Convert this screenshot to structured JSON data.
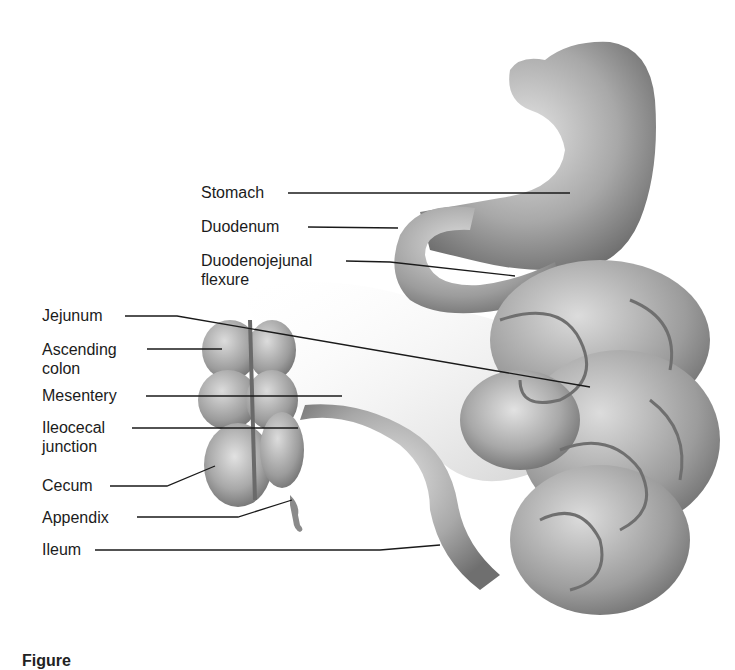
{
  "figure": {
    "caption_partial": "Figure",
    "labels": [
      {
        "id": "stomach",
        "text": "Stomach"
      },
      {
        "id": "duodenum",
        "text": "Duodenum"
      },
      {
        "id": "duodenojejunal",
        "line1": "Duodenojejunal",
        "line2": "flexure"
      },
      {
        "id": "jejunum",
        "text": "Jejunum"
      },
      {
        "id": "ascending",
        "line1": "Ascending",
        "line2": "colon"
      },
      {
        "id": "mesentery",
        "text": "Mesentery"
      },
      {
        "id": "ileocecal",
        "line1": "Ileocecal",
        "line2": "junction"
      },
      {
        "id": "cecum",
        "text": "Cecum"
      },
      {
        "id": "appendix",
        "text": "Appendix"
      },
      {
        "id": "ileum",
        "text": "Ileum"
      }
    ]
  },
  "colors": {
    "organ_fill": "#a9a9a9",
    "organ_shade": "#7d7d7d",
    "organ_light": "#d8d8d8",
    "leader": "#1a1a1a"
  }
}
